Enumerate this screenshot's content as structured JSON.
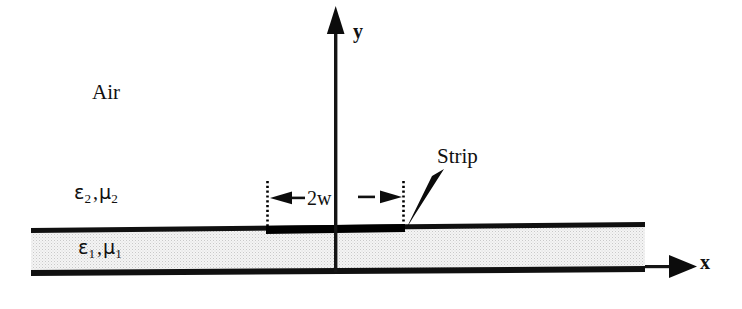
{
  "figure": {
    "background_color": "#ffffff",
    "line_color": "#000000",
    "slab_fill_color": "#ebebeb"
  },
  "axes": {
    "y_label": "y",
    "x_label": "x",
    "origin_note": "origin at slab centre"
  },
  "regions": {
    "air_label": "Air",
    "upper_medium": {
      "permittivity": "ε",
      "permittivity_subscript": "2",
      "separator": ",",
      "permeability": "μ",
      "permeability_subscript": "2"
    },
    "slab_medium": {
      "permittivity": "ε",
      "permittivity_subscript": "1",
      "separator": ",",
      "permeability": "μ",
      "permeability_subscript": "1"
    }
  },
  "annotations": {
    "strip_label": "Strip",
    "width_label": "2w"
  }
}
